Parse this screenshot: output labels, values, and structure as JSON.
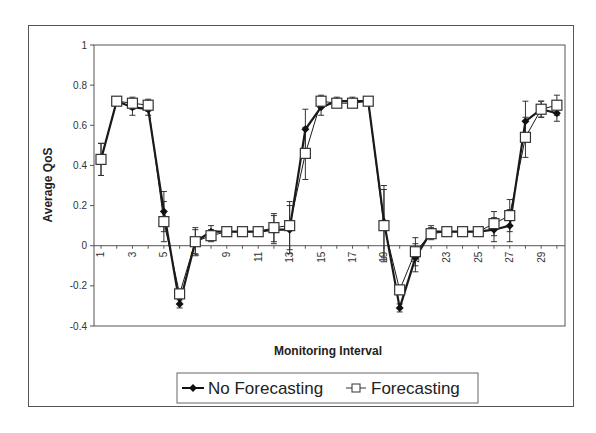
{
  "chart_data": {
    "type": "line",
    "title": "",
    "xlabel": "Monitoring Interval",
    "ylabel": "Average QoS",
    "ylim": [
      -0.4,
      1
    ],
    "yticks": [
      -0.4,
      -0.2,
      0,
      0.2,
      0.4,
      0.6,
      0.8,
      1
    ],
    "ytick_labels": [
      "-0.4",
      "-0.2",
      "0",
      "0.2",
      "0.4",
      "0.6",
      "0.8",
      "1"
    ],
    "xtick_labels": [
      "1",
      "3",
      "5",
      "7",
      "9",
      "11",
      "13",
      "15",
      "17",
      "19",
      "21",
      "23",
      "25",
      "27",
      "29"
    ],
    "x": [
      1,
      2,
      3,
      4,
      5,
      6,
      7,
      8,
      9,
      10,
      11,
      12,
      13,
      14,
      15,
      16,
      17,
      18,
      19,
      20,
      21,
      22,
      23,
      24,
      25,
      26,
      27,
      28,
      29,
      30
    ],
    "grid": false,
    "legend_position": "bottom",
    "series": [
      {
        "name": "No Forecasting",
        "marker": "filled-diamond",
        "color": "#1a1a1a",
        "values": [
          0.43,
          0.72,
          0.69,
          0.68,
          0.17,
          -0.29,
          0.02,
          0.07,
          0.07,
          0.07,
          0.07,
          0.08,
          0.08,
          0.58,
          0.69,
          0.72,
          0.72,
          0.72,
          0.12,
          -0.31,
          -0.06,
          0.07,
          0.07,
          0.07,
          0.07,
          0.08,
          0.1,
          0.62,
          0.68,
          0.66
        ],
        "error": [
          0.08,
          0.02,
          0.04,
          0.03,
          0.1,
          0.02,
          0.06,
          0.03,
          0.01,
          0.01,
          0.01,
          0.07,
          0.12,
          0.1,
          0.04,
          0.02,
          0.02,
          0.01,
          0.18,
          0.02,
          0.07,
          0.03,
          0.01,
          0.01,
          0.01,
          0.06,
          0.08,
          0.1,
          0.04,
          0.04
        ]
      },
      {
        "name": "Forecasting",
        "marker": "open-square",
        "color": "#1a1a1a",
        "values": [
          0.43,
          0.72,
          0.71,
          0.7,
          0.12,
          -0.24,
          0.02,
          0.05,
          0.07,
          0.07,
          0.07,
          0.09,
          0.1,
          0.46,
          0.72,
          0.71,
          0.71,
          0.72,
          0.1,
          -0.22,
          -0.03,
          0.06,
          0.07,
          0.07,
          0.07,
          0.11,
          0.15,
          0.54,
          0.68,
          0.7
        ],
        "error": [
          0.08,
          0.02,
          0.03,
          0.03,
          0.1,
          0.02,
          0.07,
          0.03,
          0.01,
          0.01,
          0.01,
          0.07,
          0.12,
          0.13,
          0.03,
          0.02,
          0.02,
          0.01,
          0.18,
          0.02,
          0.07,
          0.03,
          0.01,
          0.01,
          0.01,
          0.06,
          0.08,
          0.1,
          0.04,
          0.05
        ]
      }
    ]
  },
  "legend": {
    "items": [
      {
        "label": "No Forecasting"
      },
      {
        "label": "Forecasting"
      }
    ]
  }
}
